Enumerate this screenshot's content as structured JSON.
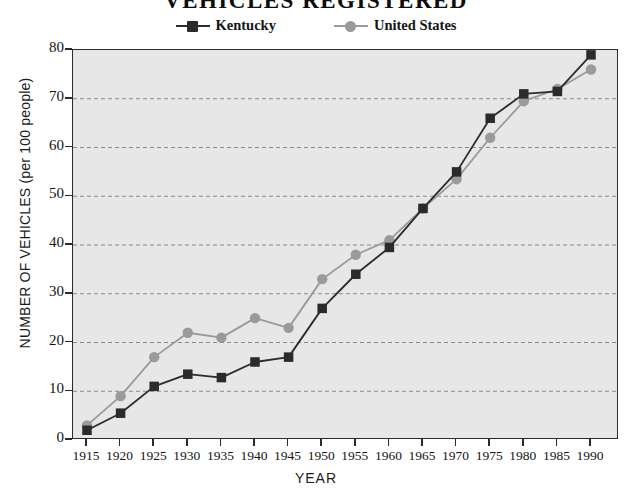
{
  "chart_data": {
    "type": "line",
    "title": "VEHICLES  REGISTERED",
    "xlabel": "YEAR",
    "ylabel": "NUMBER OF VEHICLES (per 100 people)",
    "categories": [
      1915,
      1920,
      1925,
      1930,
      1935,
      1940,
      1945,
      1950,
      1955,
      1960,
      1965,
      1970,
      1975,
      1980,
      1985,
      1990
    ],
    "xtick_labels": [
      "1915",
      "1920",
      "1925",
      "1930",
      "1935",
      "1940",
      "1945",
      "1950",
      "1955",
      "1960",
      "1965",
      "1970",
      "1975",
      "1980",
      "1985",
      "1990"
    ],
    "ytick_labels": [
      "0",
      "10",
      "20",
      "30",
      "40",
      "50",
      "60",
      "70",
      "80"
    ],
    "yticks": [
      0,
      10,
      20,
      30,
      40,
      50,
      60,
      70,
      80
    ],
    "ylim": [
      0,
      80
    ],
    "xlim": [
      1915,
      1990
    ],
    "grid": "horizontal-dashed",
    "legend_position": "top-center",
    "series": [
      {
        "name": "Kentucky",
        "marker": "square",
        "color": "#2b2b2b",
        "values": [
          2,
          5.5,
          11,
          13.5,
          12.8,
          16,
          17,
          27,
          34,
          39.5,
          47.5,
          55,
          66,
          71,
          71.5,
          79
        ]
      },
      {
        "name": "United States",
        "marker": "circle",
        "color": "#9a9a9a",
        "values": [
          3,
          9,
          17,
          22,
          21,
          25,
          23,
          33,
          38,
          41,
          47.5,
          53.5,
          62,
          69.5,
          72,
          76
        ]
      }
    ]
  },
  "legend": {
    "entries": [
      {
        "label": "Kentucky",
        "marker": "square",
        "color": "#2b2b2b"
      },
      {
        "label": "United States",
        "marker": "circle",
        "color": "#9a9a9a"
      }
    ]
  },
  "colors": {
    "plot_background": "#e7e7e7",
    "page_background": "#ffffff",
    "axis": "#2b2b2b",
    "grid": "#8a8a8a",
    "kentucky": "#2b2b2b",
    "united_states": "#9a9a9a"
  }
}
